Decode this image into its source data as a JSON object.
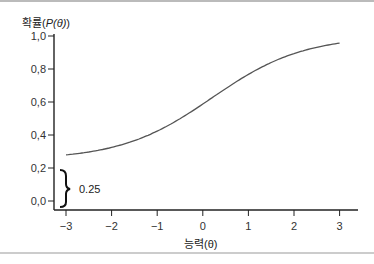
{
  "chart_data": {
    "type": "line",
    "title": "",
    "xlabel": "능력(θ)",
    "ylabel": "확률(P(θ))",
    "xlim": [
      -3,
      3
    ],
    "ylim": [
      0,
      1.0
    ],
    "x_ticks": [
      "−3",
      "−2",
      "−1",
      "0",
      "1",
      "2",
      "3"
    ],
    "y_ticks": [
      "0.0",
      "0.2",
      "0.4",
      "0.6",
      "0.8",
      "1.0"
    ],
    "grid": false,
    "series": [
      {
        "name": "item characteristic curve",
        "x": [
          -3,
          -2.5,
          -2,
          -1.5,
          -1,
          -0.5,
          0,
          0.5,
          1,
          1.5,
          2,
          2.5,
          3
        ],
        "values": [
          0.28,
          0.3,
          0.33,
          0.37,
          0.43,
          0.51,
          0.59,
          0.68,
          0.76,
          0.83,
          0.88,
          0.92,
          0.95
        ]
      }
    ],
    "annotations": [
      {
        "type": "brace",
        "from": 0.0,
        "to": 0.25,
        "x": -3,
        "label": "0.25"
      }
    ]
  },
  "labels": {
    "ylabel_prefix": "확률(",
    "ylabel_mid": "P(θ)",
    "ylabel_suffix": ")",
    "xlabel": "능력(θ)",
    "brace_label": "0.25"
  }
}
